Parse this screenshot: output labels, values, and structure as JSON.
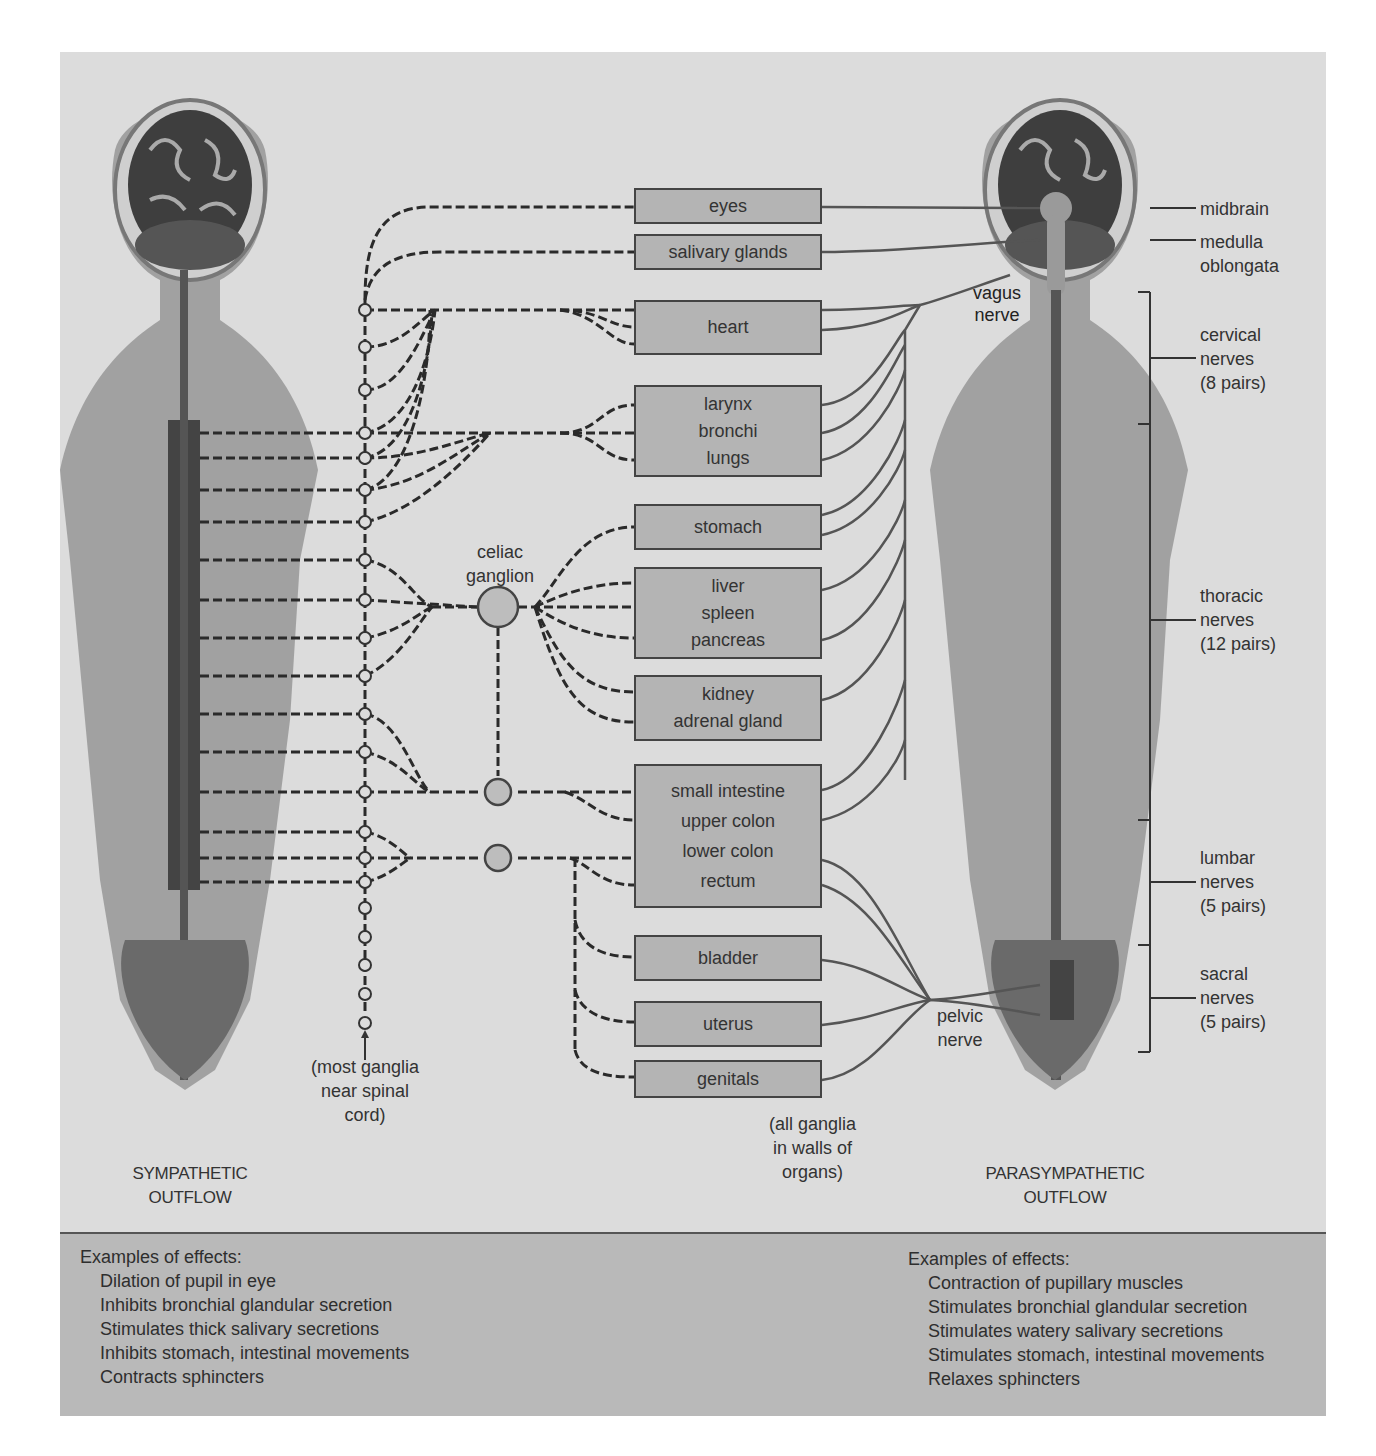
{
  "diagram": {
    "left_title": [
      "SYMPATHETIC",
      "OUTFLOW"
    ],
    "right_title": [
      "PARASYMPATHETIC",
      "OUTFLOW"
    ],
    "organs": [
      {
        "id": "eyes",
        "lines": [
          "eyes"
        ]
      },
      {
        "id": "salivary",
        "lines": [
          "salivary glands"
        ]
      },
      {
        "id": "heart",
        "lines": [
          "heart"
        ]
      },
      {
        "id": "lungs",
        "lines": [
          "larynx",
          "bronchi",
          "lungs"
        ]
      },
      {
        "id": "stomach",
        "lines": [
          "stomach"
        ]
      },
      {
        "id": "liver",
        "lines": [
          "liver",
          "spleen",
          "pancreas"
        ]
      },
      {
        "id": "kidney",
        "lines": [
          "kidney",
          "adrenal gland"
        ]
      },
      {
        "id": "intestine",
        "lines": [
          "small intestine",
          "upper colon",
          "lower colon",
          "rectum"
        ]
      },
      {
        "id": "bladder",
        "lines": [
          "bladder"
        ]
      },
      {
        "id": "uterus",
        "lines": [
          "uterus"
        ]
      },
      {
        "id": "genitals",
        "lines": [
          "genitals"
        ]
      }
    ],
    "labels": {
      "celiac": [
        "celiac",
        "ganglion"
      ],
      "most_ganglia": [
        "(most ganglia",
        "near spinal",
        "cord)"
      ],
      "all_ganglia": [
        "(all ganglia",
        "in walls of",
        "organs)"
      ],
      "vagus": [
        "vagus",
        "nerve"
      ],
      "pelvic": [
        "pelvic",
        "nerve"
      ],
      "midbrain": "midbrain",
      "medulla": [
        "medulla",
        "oblongata"
      ],
      "cervical": [
        "cervical",
        "nerves",
        "(8 pairs)"
      ],
      "thoracic": [
        "thoracic",
        "nerves",
        "(12 pairs)"
      ],
      "lumbar": [
        "lumbar",
        "nerves",
        "(5 pairs)"
      ],
      "sacral": [
        "sacral",
        "nerves",
        "(5 pairs)"
      ]
    }
  },
  "effects": {
    "sympathetic": {
      "heading": "Examples of effects:",
      "items": [
        "Dilation of pupil in eye",
        "Inhibits bronchial glandular secretion",
        "Stimulates thick salivary secretions",
        "Inhibits stomach, intestinal movements",
        "Contracts sphincters"
      ]
    },
    "parasympathetic": {
      "heading": "Examples of effects:",
      "items": [
        "Contraction of pupillary muscles",
        "Stimulates bronchial glandular secretion",
        "Stimulates watery salivary secretions",
        "Stimulates stomach, intestinal movements",
        "Relaxes sphincters"
      ]
    }
  },
  "colors": {
    "panel": "#dcdcdc",
    "footer": "#b9b9b9",
    "organ_box": "#b4b4b4",
    "line": "#333333"
  }
}
